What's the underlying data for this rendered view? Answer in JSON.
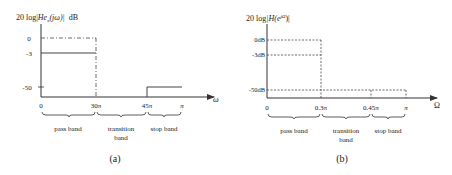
{
  "panel_a": {
    "y_label": "20 log|Heₐ(jω)|  dB",
    "y_label_main": "20 log|",
    "y_label_fn": "He",
    "y_label_sub": "a",
    "y_label_arg": "(jω)|",
    "y_label_unit": "dB",
    "y_ticks": [
      "0",
      "-3",
      "-50"
    ],
    "x_ticks": [
      "0",
      "30π",
      "45π",
      "π"
    ],
    "x_axis_label": "ω",
    "bands": [
      "pass band",
      "transition",
      "band",
      "stop band"
    ],
    "caption": "(a)"
  },
  "panel_b": {
    "y_label_main": "20 log",
    "y_label_fn": "|H(e",
    "y_label_sup": "jΩ",
    "y_label_end": ")|",
    "y_ticks": [
      "0dB",
      "-3dB",
      "-50dB"
    ],
    "x_ticks": [
      "0",
      "0.3π",
      "0.45π",
      "π"
    ],
    "x_axis_label": "Ω",
    "bands": [
      "pass band",
      "transition",
      "band",
      "stop band"
    ],
    "caption": "(b)"
  }
}
